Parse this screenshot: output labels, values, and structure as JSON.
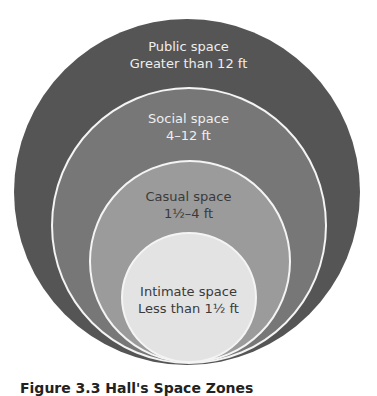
{
  "diagram": {
    "type": "nested-circles",
    "zones": [
      {
        "name": "Public space",
        "distance": "Greater than 12 ft",
        "color": "#555555"
      },
      {
        "name": "Social space",
        "distance": "4–12 ft",
        "color": "#777777"
      },
      {
        "name": "Casual space",
        "distance": "1½–4 ft",
        "color": "#9b9b9b"
      },
      {
        "name": "Intimate space",
        "distance": "Less than 1½ ft",
        "color": "#e3e3e3"
      }
    ]
  },
  "caption": "Figure 3.3 Hall's Space Zones"
}
